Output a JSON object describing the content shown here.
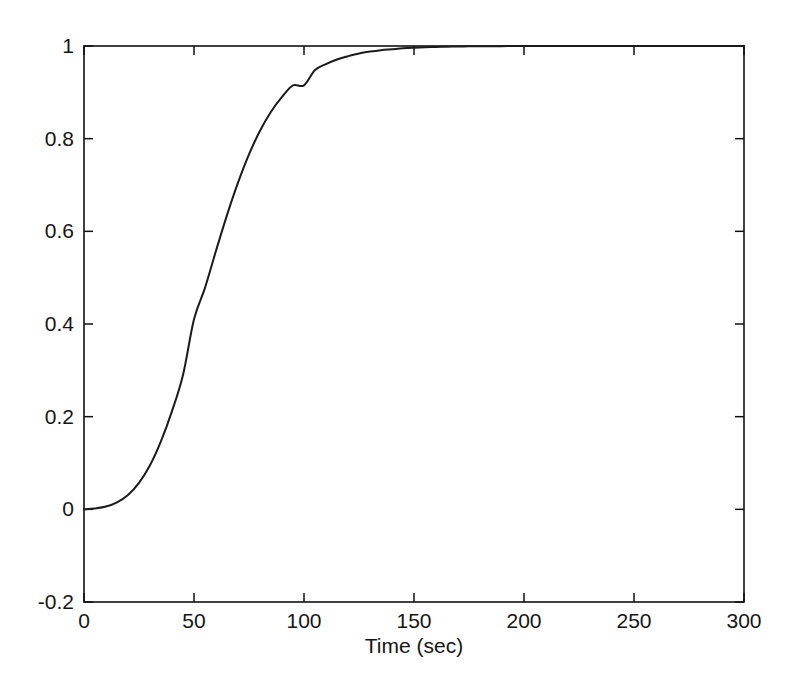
{
  "figure": {
    "background": "#ffffff",
    "line_color": "#1b1b1b",
    "axis_color": "#111111"
  },
  "chart_data": {
    "type": "line",
    "title": "",
    "subtitle": "",
    "xlabel": "Time (sec)",
    "ylabel": "",
    "xlim": [
      0,
      300
    ],
    "ylim": [
      -0.2,
      1
    ],
    "xticks": [
      0,
      50,
      100,
      150,
      200,
      250,
      300
    ],
    "xticklabels": [
      "0",
      "50",
      "100",
      "150",
      "200",
      "250",
      "300"
    ],
    "yticks": [
      -0.2,
      0,
      0.2,
      0.4,
      0.6,
      0.8,
      1
    ],
    "yticklabels": [
      "-0.2",
      "0",
      "0.2",
      "0.4",
      "0.6",
      "0.8",
      "1"
    ],
    "grid": false,
    "legend": null,
    "box": true,
    "tick_direction": "in",
    "series": [
      {
        "name": "step response",
        "color": "#1b1b1b",
        "x": [
          0,
          5,
          10,
          15,
          20,
          25,
          30,
          35,
          40,
          45,
          50,
          55,
          60,
          65,
          70,
          75,
          80,
          85,
          90,
          95,
          100,
          105,
          110,
          115,
          120,
          125,
          130,
          135,
          140,
          145,
          150,
          155,
          160,
          165,
          170,
          175,
          180,
          185,
          190,
          195,
          200,
          210,
          220,
          230,
          240,
          250,
          260,
          270,
          280,
          290,
          300
        ],
        "y": [
          0.0,
          0.002,
          0.006,
          0.015,
          0.031,
          0.057,
          0.095,
          0.147,
          0.212,
          0.29,
          0.41,
          0.478,
          0.558,
          0.635,
          0.705,
          0.766,
          0.817,
          0.858,
          0.89,
          0.915,
          0.87,
          0.948,
          0.961,
          0.971,
          0.978,
          0.984,
          0.988,
          0.991,
          0.993,
          0.995,
          0.9963,
          0.9973,
          0.998,
          0.9985,
          0.9989,
          0.9992,
          0.9994,
          0.9996,
          0.9997,
          0.9998,
          0.9998,
          0.9999,
          0.9999,
          1.0,
          1.0,
          1.0,
          1.0,
          1.0,
          1.0,
          1.0,
          1.0
        ]
      }
    ],
    "annotations": []
  }
}
